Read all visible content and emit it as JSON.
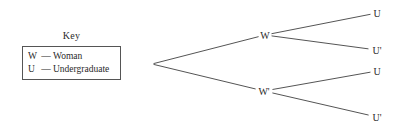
{
  "canvas": {
    "width": 406,
    "height": 131,
    "background": "#ffffff",
    "line_color": "#555555",
    "text_color": "#2a2a2a"
  },
  "key": {
    "title": "Key",
    "entries": [
      {
        "symbol": "W",
        "dash": "—",
        "description": "Woman"
      },
      {
        "symbol": "U",
        "dash": "—",
        "description": "Undergraduate"
      }
    ]
  },
  "chart_data": {
    "type": "diagram",
    "diagram_kind": "probability-tree",
    "title": "",
    "nodes": [
      {
        "id": "root",
        "label": "",
        "x": 152,
        "y": 64,
        "level": 0
      },
      {
        "id": "w",
        "label": "W",
        "x": 265,
        "y": 35,
        "level": 1
      },
      {
        "id": "wprime",
        "label": "W'",
        "x": 264,
        "y": 91,
        "level": 1
      },
      {
        "id": "u1",
        "label": "U",
        "x": 377,
        "y": 13,
        "level": 2
      },
      {
        "id": "u1p",
        "label": "U'",
        "x": 377,
        "y": 50,
        "level": 2
      },
      {
        "id": "u2",
        "label": "U",
        "x": 377,
        "y": 71,
        "level": 2
      },
      {
        "id": "u2p",
        "label": "U'",
        "x": 377,
        "y": 117,
        "level": 2
      }
    ],
    "edges": [
      {
        "from": "root",
        "to": "w",
        "label": ""
      },
      {
        "from": "root",
        "to": "wprime",
        "label": ""
      },
      {
        "from": "w",
        "to": "u1",
        "label": ""
      },
      {
        "from": "w",
        "to": "u1p",
        "label": ""
      },
      {
        "from": "wprime",
        "to": "u2",
        "label": ""
      },
      {
        "from": "wprime",
        "to": "u2p",
        "label": ""
      }
    ]
  }
}
